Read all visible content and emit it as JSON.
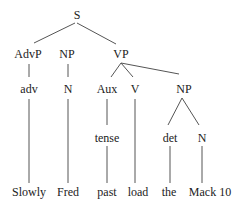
{
  "tree": {
    "title": "Syntax tree",
    "nodes": [
      {
        "id": "S",
        "label": "S",
        "x": 77,
        "y": 15
      },
      {
        "id": "AdvP",
        "label": "AdvP",
        "x": 28,
        "y": 54
      },
      {
        "id": "NP1",
        "label": "NP",
        "x": 67,
        "y": 54
      },
      {
        "id": "VP",
        "label": "VP",
        "x": 121,
        "y": 54
      },
      {
        "id": "adv",
        "label": "adv",
        "x": 29,
        "y": 89
      },
      {
        "id": "N1",
        "label": "N",
        "x": 68,
        "y": 89
      },
      {
        "id": "Aux",
        "label": "Aux",
        "x": 107,
        "y": 89
      },
      {
        "id": "V",
        "label": "V",
        "x": 135,
        "y": 89
      },
      {
        "id": "NP2",
        "label": "NP",
        "x": 184,
        "y": 89
      },
      {
        "id": "tense",
        "label": "tense",
        "x": 107,
        "y": 138
      },
      {
        "id": "det",
        "label": "det",
        "x": 170,
        "y": 138
      },
      {
        "id": "N2",
        "label": "N",
        "x": 202,
        "y": 138
      },
      {
        "id": "w1",
        "label": "Slowly",
        "x": 29,
        "y": 192
      },
      {
        "id": "w2",
        "label": "Fred",
        "x": 68,
        "y": 192
      },
      {
        "id": "w3",
        "label": "past",
        "x": 107,
        "y": 192
      },
      {
        "id": "w4",
        "label": "load",
        "x": 138,
        "y": 192
      },
      {
        "id": "w5",
        "label": "the",
        "x": 169,
        "y": 192
      },
      {
        "id": "w6",
        "label": "Mack 10",
        "x": 210,
        "y": 192
      }
    ],
    "edges": [
      {
        "from": "S",
        "to": "AdvP",
        "x1": 75,
        "y1": 23,
        "x2": 34,
        "y2": 43
      },
      {
        "from": "S",
        "to": "VP",
        "x1": 77,
        "y1": 23,
        "x2": 116,
        "y2": 44
      },
      {
        "from": "AdvP",
        "to": "adv",
        "x1": 29,
        "y1": 64,
        "x2": 29,
        "y2": 77
      },
      {
        "from": "NP1",
        "to": "N1",
        "x1": 68,
        "y1": 64,
        "x2": 68,
        "y2": 77
      },
      {
        "from": "VP",
        "to": "Aux",
        "x1": 121,
        "y1": 63,
        "x2": 111,
        "y2": 77
      },
      {
        "from": "VP",
        "to": "V",
        "x1": 121,
        "y1": 63,
        "x2": 133,
        "y2": 77
      },
      {
        "from": "VP",
        "to": "NP2",
        "x1": 121,
        "y1": 63,
        "x2": 179,
        "y2": 74
      },
      {
        "from": "adv",
        "to": "Slowly",
        "x1": 29,
        "y1": 99,
        "x2": 29,
        "y2": 183
      },
      {
        "from": "N1",
        "to": "Fred",
        "x1": 68,
        "y1": 99,
        "x2": 68,
        "y2": 183
      },
      {
        "from": "Aux",
        "to": "tense",
        "x1": 107,
        "y1": 99,
        "x2": 107,
        "y2": 125
      },
      {
        "from": "V",
        "to": "load",
        "x1": 135,
        "y1": 99,
        "x2": 135,
        "y2": 183
      },
      {
        "from": "NP2",
        "to": "det",
        "x1": 182,
        "y1": 98,
        "x2": 168,
        "y2": 125
      },
      {
        "from": "NP2",
        "to": "N2",
        "x1": 182,
        "y1": 98,
        "x2": 199,
        "y2": 125
      },
      {
        "from": "tense",
        "to": "past",
        "x1": 107,
        "y1": 146,
        "x2": 107,
        "y2": 183
      },
      {
        "from": "det",
        "to": "the",
        "x1": 170,
        "y1": 146,
        "x2": 170,
        "y2": 183
      },
      {
        "from": "N2",
        "to": "Mack 10",
        "x1": 202,
        "y1": 146,
        "x2": 202,
        "y2": 183
      }
    ],
    "colors": {
      "line": "#555555",
      "text": "#222222",
      "background": "#ffffff"
    }
  }
}
